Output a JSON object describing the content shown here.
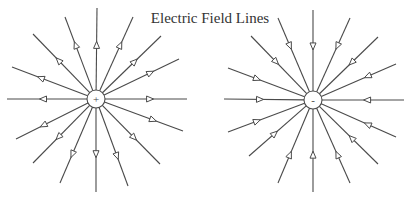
{
  "title": "Electric Field Lines",
  "colors": {
    "line": "#4a4a4a",
    "background": "#ffffff"
  },
  "charges": [
    {
      "name": "positive",
      "sign": "+",
      "center": [
        96,
        99
      ],
      "radius": 9,
      "direction": "outward",
      "endpoints": [
        [
          97,
          8
        ],
        [
          133,
          17
        ],
        [
          161,
          36
        ],
        [
          179,
          59
        ],
        [
          187,
          99
        ],
        [
          183,
          131
        ],
        [
          160,
          164
        ],
        [
          128,
          186
        ],
        [
          96,
          192
        ],
        [
          60,
          183
        ],
        [
          33,
          163
        ],
        [
          16,
          139
        ],
        [
          7,
          99
        ],
        [
          12,
          67
        ],
        [
          33,
          34
        ],
        [
          65,
          17
        ]
      ]
    },
    {
      "name": "negative",
      "sign": "-",
      "center": [
        313,
        100
      ],
      "radius": 9,
      "direction": "inward",
      "endpoints": [
        [
          313,
          10
        ],
        [
          350,
          18
        ],
        [
          378,
          37
        ],
        [
          396,
          64
        ],
        [
          404,
          100
        ],
        [
          396,
          137
        ],
        [
          378,
          164
        ],
        [
          350,
          183
        ],
        [
          313,
          192
        ],
        [
          278,
          183
        ],
        [
          249,
          156
        ],
        [
          228,
          132
        ],
        [
          224,
          99
        ],
        [
          228,
          68
        ],
        [
          251,
          36
        ],
        [
          278,
          18
        ]
      ]
    }
  ]
}
